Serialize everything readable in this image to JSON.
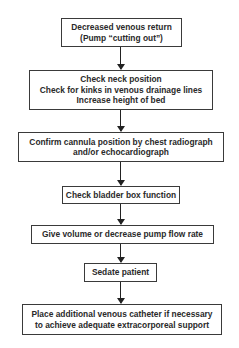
{
  "flowchart": {
    "direction": "top-to-bottom",
    "steps": [
      {
        "id": "decreased-venous-return",
        "lines": [
          "Decreased venous return",
          "(Pump “cutting out”)"
        ]
      },
      {
        "id": "check-neck-position",
        "lines": [
          "Check neck position",
          "Check for kinks in venous drainage lines",
          "Increase height of bed"
        ]
      },
      {
        "id": "confirm-cannula-position",
        "lines": [
          "Confirm cannula position by chest radiograph",
          "and/or echocardiograph"
        ]
      },
      {
        "id": "check-bladder-box",
        "lines": [
          "Check bladder box function"
        ]
      },
      {
        "id": "give-volume",
        "lines": [
          "Give volume or decrease pump flow rate"
        ]
      },
      {
        "id": "sedate-patient",
        "lines": [
          "Sedate patient"
        ]
      },
      {
        "id": "place-venous-catheter",
        "lines": [
          "Place additional venous catheter if necessary",
          "to achieve adequate extracorporeal support"
        ]
      }
    ],
    "colors": {
      "border": "#3a3a3a",
      "text": "#2a2a2a",
      "arrow": "#222222",
      "background": "#ffffff"
    }
  }
}
